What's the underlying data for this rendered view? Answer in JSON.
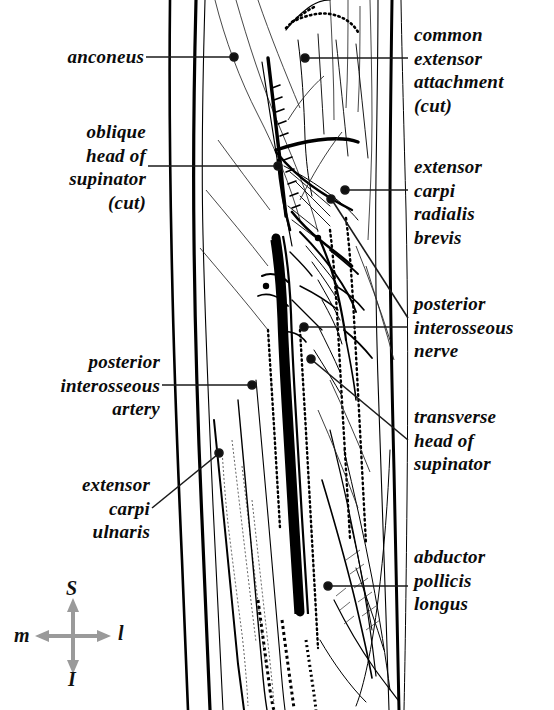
{
  "figure": {
    "style": "black-and-white anatomical line drawing",
    "background_color": "#ffffff",
    "ink_color": "#000000",
    "leader_color": "#1a1a1a",
    "compass_arrow_color": "#9a9a9a"
  },
  "labels": [
    {
      "id": "anconeus",
      "text": "anconeus",
      "side": "left",
      "lines": 1
    },
    {
      "id": "oblique-head-of-supinator",
      "text": "oblique\nhead of\nsupinator\n(cut)",
      "side": "left",
      "lines": 4
    },
    {
      "id": "posterior-interosseous-artery",
      "text": "posterior\ninterosseous\nartery",
      "side": "left",
      "lines": 3
    },
    {
      "id": "extensor-carpi-ulnaris",
      "text": "extensor\ncarpi\nulnaris",
      "side": "left",
      "lines": 3
    },
    {
      "id": "common-extensor-attachment",
      "text": "common\nextensor\nattachment\n(cut)",
      "side": "right",
      "lines": 4
    },
    {
      "id": "extensor-carpi-radialis-brevis",
      "text": "extensor\ncarpi\nradialis\nbrevis",
      "side": "right",
      "lines": 4
    },
    {
      "id": "posterior-interosseous-nerve",
      "text": "posterior\ninterosseous\nnerve",
      "side": "right",
      "lines": 3
    },
    {
      "id": "transverse-head-of-supinator",
      "text": "transverse\nhead of\nsupinator",
      "side": "right",
      "lines": 3
    },
    {
      "id": "abductor-pollicis-longus",
      "text": "abductor\npollicis\nlongus",
      "side": "right",
      "lines": 3
    }
  ],
  "compass": {
    "superior": "S",
    "inferior": "I",
    "medial": "m",
    "lateral": "l"
  }
}
